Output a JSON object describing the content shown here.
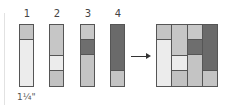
{
  "colors": {
    "light": "#ececec",
    "mid": "#c2c2c2",
    "dark": "#6a6a6a",
    "border": "#555555"
  },
  "strips": [
    {
      "label": "1",
      "segments": [
        {
          "h": 15,
          "c": "#c4c4c4"
        },
        {
          "h": 46,
          "c": "#ececec"
        }
      ]
    },
    {
      "label": "2",
      "segments": [
        {
          "h": 31,
          "c": "#c6c6c6"
        },
        {
          "h": 15,
          "c": "#ececec"
        },
        {
          "h": 15,
          "c": "#c2c2c2"
        }
      ]
    },
    {
      "label": "3",
      "segments": [
        {
          "h": 15,
          "c": "#c8c8c8"
        },
        {
          "h": 15,
          "c": "#6e6e6e"
        },
        {
          "h": 31,
          "c": "#c4c4c4"
        }
      ]
    },
    {
      "label": "4",
      "segments": [
        {
          "h": 46,
          "c": "#6a6a6a"
        },
        {
          "h": 15,
          "c": "#c4c4c4"
        }
      ]
    }
  ],
  "measurement": "1¼\"",
  "arrow": "right-arrow"
}
